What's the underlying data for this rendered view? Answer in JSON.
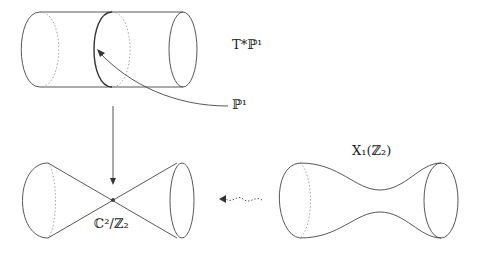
{
  "diagram": {
    "type": "blow-up / resolution of singularity diagram",
    "nodes": [
      {
        "id": "cotangent",
        "label": "T*ℙ¹",
        "shape": "cylinder"
      },
      {
        "id": "sphere",
        "label": "ℙ¹",
        "shape": "zero-section circle on cylinder"
      },
      {
        "id": "orbifold",
        "label": "ℂ²/ℤ₂",
        "shape": "double cone"
      },
      {
        "id": "hyperkahler",
        "label": "X₁(ℤ₂)",
        "shape": "hourglass / neck surface"
      }
    ],
    "edges": [
      {
        "from": "cotangent",
        "to": "orbifold",
        "style": "solid arrow"
      },
      {
        "from": "sphere",
        "to": "cotangent",
        "style": "curved pointer arrow"
      },
      {
        "from": "hyperkahler",
        "to": "orbifold",
        "style": "dotted wavy arrow"
      }
    ]
  },
  "labels": {
    "cotangent": "T*ℙ¹",
    "sphere": "ℙ¹",
    "orbifold": "ℂ²/ℤ₂",
    "hyperkahler": "X₁(ℤ₂)"
  },
  "colors": {
    "stroke": "#333333",
    "dotted": "#888888"
  }
}
